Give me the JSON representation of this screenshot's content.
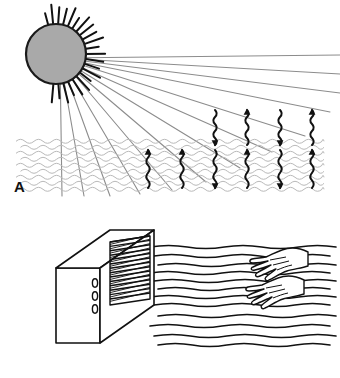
{
  "figure": {
    "width": 340,
    "height": 378,
    "background_color": "#ffffff"
  },
  "panels": [
    {
      "id": "A",
      "label": "A",
      "caption": "Sun radiating energy onto a body of water with wavy energy arrows entering and leaving the surface",
      "label_position": {
        "x": 14,
        "y": 179
      },
      "sun": {
        "name": "sun",
        "center_x": 56,
        "center_y": 54,
        "radius": 30,
        "fill_color": "#a9a9a9",
        "stroke_color": "#1a1a1a",
        "stroke_width": 2.2,
        "spike_count": 22,
        "spike_color": "#111111",
        "spike_length_min": 8,
        "spike_length_max": 20,
        "spike_start_angle_deg": -105,
        "spike_end_angle_deg": 95
      },
      "rays": {
        "name": "sun-rays",
        "color": "#8c8c8c",
        "width": 1.1,
        "count": 13,
        "origin_x": 60,
        "origin_y": 58,
        "end_points": [
          {
            "x": 340,
            "y": 55
          },
          {
            "x": 340,
            "y": 74
          },
          {
            "x": 340,
            "y": 93
          },
          {
            "x": 330,
            "y": 112
          },
          {
            "x": 305,
            "y": 136
          },
          {
            "x": 272,
            "y": 152
          },
          {
            "x": 240,
            "y": 168
          },
          {
            "x": 206,
            "y": 182
          },
          {
            "x": 172,
            "y": 190
          },
          {
            "x": 140,
            "y": 194
          },
          {
            "x": 110,
            "y": 196
          },
          {
            "x": 84,
            "y": 196
          },
          {
            "x": 62,
            "y": 196
          }
        ]
      },
      "water": {
        "name": "water-body",
        "x": 16,
        "y": 138,
        "width": 308,
        "height": 54,
        "wave_color": "#b9b9b9",
        "wave_rows": 9,
        "wave_amplitude": 1.8,
        "wave_period": 9
      },
      "arrows_above_water": {
        "name": "radiation-arrows-above-water",
        "color": "#111111",
        "direction_sequence": [
          "down",
          "up",
          "down",
          "up"
        ],
        "x_positions": [
          215,
          247,
          280,
          312
        ],
        "top_y": 110,
        "bottom_y": 145
      },
      "arrows_in_water": {
        "name": "energy-arrows-in-water",
        "color": "#111111",
        "direction_sequence": [
          "up",
          "up",
          "down",
          "up",
          "down",
          "up"
        ],
        "x_positions": [
          148,
          182,
          215,
          247,
          280,
          312
        ],
        "top_y": 150,
        "bottom_y": 188
      }
    },
    {
      "id": "B",
      "label": "B",
      "caption": "Electric heater with louvred grille blowing warm air toward two open hands",
      "label_position": {
        "x": 14,
        "y": 352
      },
      "heater": {
        "name": "heater-unit",
        "outline_color": "#111111",
        "fill_color": "#ffffff",
        "stroke_width": 1.6,
        "front_face": {
          "x": 56,
          "y": 268,
          "width": 44,
          "height": 75
        },
        "top_face_depth_x": 54,
        "top_face_depth_y": -38,
        "grille": {
          "name": "heater-grille",
          "slat_count": 14,
          "slat_color": "#111111",
          "slat_width": 1.5
        },
        "knobs": {
          "name": "heater-control-knobs",
          "count": 3,
          "shape": "ellipse",
          "rx": 2.6,
          "ry": 4.2,
          "color": "#111111",
          "x": 95,
          "y_positions": [
            283,
            296,
            309
          ]
        }
      },
      "airflow": {
        "name": "warm-air-flow-lines",
        "color": "#111111",
        "width": 1.5,
        "line_count": 12,
        "start_x": 150,
        "end_x": 336,
        "y_positions": [
          247,
          256,
          265,
          273,
          281,
          289,
          297,
          305,
          316,
          326,
          336,
          345
        ]
      },
      "hands": {
        "name": "hands-feeling-warmth",
        "count": 2,
        "outline_color": "#111111",
        "fill_color": "#ffffff",
        "stroke_width": 1.4,
        "positions": [
          {
            "label": "upper-hand",
            "x": 248,
            "y": 244
          },
          {
            "label": "lower-hand",
            "x": 244,
            "y": 272
          }
        ]
      }
    }
  ]
}
